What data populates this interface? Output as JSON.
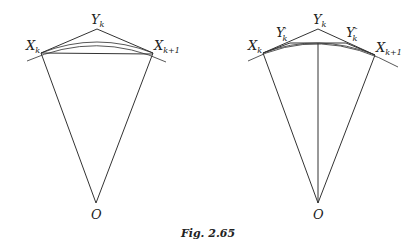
{
  "figure": {
    "caption": "Fig. 2.65",
    "left_diagram": {
      "labels": {
        "x_k": "X",
        "x_k_sub": "k",
        "y_k": "Y",
        "y_k_sub": "k",
        "x_k1": "X",
        "x_k1_sub": "k+1",
        "o": "O"
      },
      "points": {
        "X_k": [
          41,
          53
        ],
        "Y_k": [
          97,
          29
        ],
        "X_k+1": [
          153,
          53
        ],
        "O": [
          96,
          203
        ]
      }
    },
    "right_diagram": {
      "labels": {
        "x_k": "X",
        "x_k_sub": "k",
        "y_k": "Y",
        "y_k_sub": "k",
        "y_k_prime": "Y",
        "y_k_prime_sup": "′",
        "y_k_prime_sub": "k",
        "y_k_dprime": "Y",
        "y_k_dprime_sup": "″",
        "y_k_dprime_sub": "k",
        "x_k1": "X",
        "x_k1_sub": "k+1",
        "o": "O"
      },
      "points": {
        "X_k": [
          263,
          53
        ],
        "Y'_k": [
          290,
          42
        ],
        "Y_k": [
          318,
          29
        ],
        "Y''_k": [
          346,
          42
        ],
        "X_k+1": [
          375,
          55
        ],
        "O": [
          318,
          203
        ]
      }
    }
  }
}
